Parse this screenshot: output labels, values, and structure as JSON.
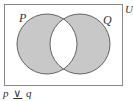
{
  "diagram": {
    "type": "venn",
    "universe_label": "U",
    "sets": [
      {
        "label": "P",
        "cx": 47,
        "cy": 44,
        "r": 30
      },
      {
        "label": "Q",
        "cx": 80,
        "cy": 44,
        "r": 30
      }
    ],
    "shaded_region": "symmetric difference (P xor Q)",
    "caption": {
      "left": "p",
      "operator": "∨",
      "right": "q"
    },
    "colors": {
      "fill": "#c8c8c8",
      "stroke": "#555555",
      "frame": "#888888",
      "background": "#ffffff"
    }
  }
}
